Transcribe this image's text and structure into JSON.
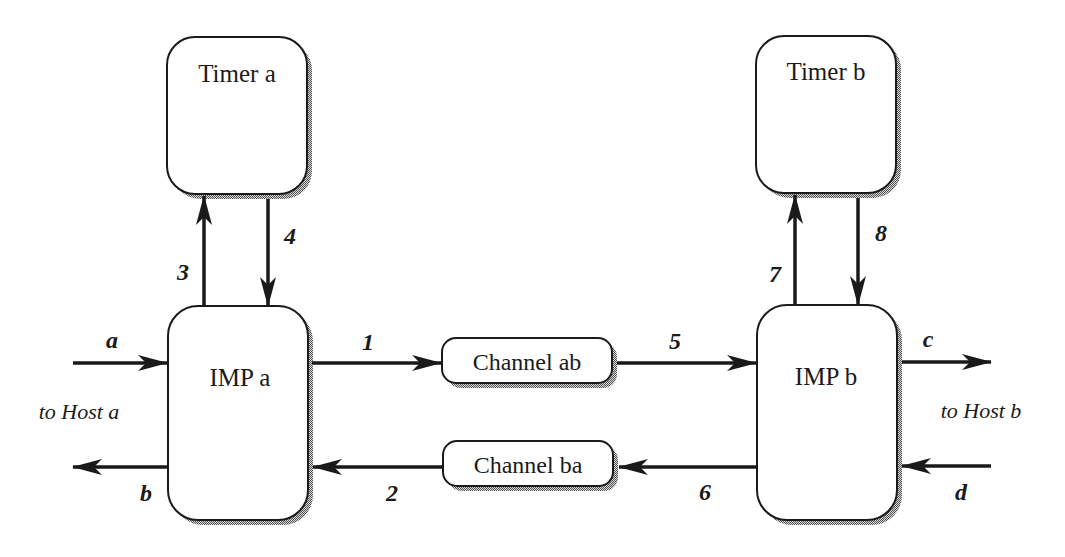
{
  "diagram": {
    "nodes": {
      "timer_a": {
        "label": "Timer a"
      },
      "timer_b": {
        "label": "Timer b"
      },
      "imp_a": {
        "label": "IMP a"
      },
      "imp_b": {
        "label": "IMP b"
      },
      "channel_ab": {
        "label": "Channel ab"
      },
      "channel_ba": {
        "label": "Channel ba"
      }
    },
    "edges": [
      {
        "id": "1",
        "label": "1",
        "from": "IMP a",
        "to": "Channel ab"
      },
      {
        "id": "2",
        "label": "2",
        "from": "Channel ba",
        "to": "IMP a"
      },
      {
        "id": "3",
        "label": "3",
        "from": "IMP a",
        "to": "Timer a"
      },
      {
        "id": "4",
        "label": "4",
        "from": "Timer a",
        "to": "IMP a"
      },
      {
        "id": "5",
        "label": "5",
        "from": "Channel ab",
        "to": "IMP b"
      },
      {
        "id": "6",
        "label": "6",
        "from": "IMP b",
        "to": "Channel ba"
      },
      {
        "id": "7",
        "label": "7",
        "from": "IMP b",
        "to": "Timer b"
      },
      {
        "id": "8",
        "label": "8",
        "from": "Timer b",
        "to": "IMP b"
      },
      {
        "id": "a",
        "label": "a",
        "from": "Host a",
        "to": "IMP a"
      },
      {
        "id": "b",
        "label": "b",
        "from": "IMP a",
        "to": "Host a"
      },
      {
        "id": "c",
        "label": "c",
        "from": "IMP b",
        "to": "Host b"
      },
      {
        "id": "d",
        "label": "d",
        "from": "Host b",
        "to": "IMP b"
      }
    ],
    "host_labels": {
      "host_a": "to Host a",
      "host_b": "to Host b"
    },
    "colors": {
      "stroke": "#1a1a1a",
      "shadow": "#8a8a8a",
      "fill": "#ffffff"
    }
  }
}
